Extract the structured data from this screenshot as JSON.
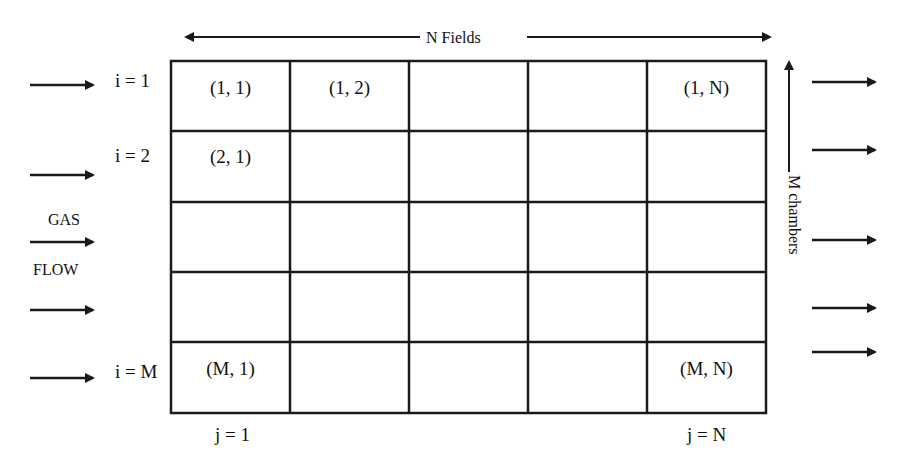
{
  "diagram": {
    "top_label": "N Fields",
    "side_label": "M chambers",
    "gas_label_1": "GAS",
    "gas_label_2": "FLOW",
    "row_labels": [
      "i = 1",
      "i = 2",
      "i = M"
    ],
    "col_labels": [
      "j = 1",
      "j = N"
    ],
    "cells": {
      "c11": "(1, 1)",
      "c12": "(1, 2)",
      "c1N": "(1, N)",
      "c21": "(2, 1)",
      "cM1": "(M, 1)",
      "cMN": "(M, N)"
    },
    "grid": {
      "rows": 5,
      "cols": 5
    },
    "line_color": "#1a1a1a"
  }
}
